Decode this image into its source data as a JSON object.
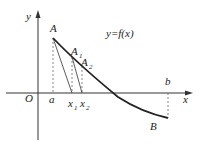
{
  "diagram": {
    "function_label": "y=f(x)",
    "axes": {
      "x_label": "x",
      "y_label": "y",
      "origin_label": "O"
    },
    "points": {
      "A": "A",
      "A1": "A",
      "A1_sub": "1",
      "A2": "A",
      "A2_sub": "2",
      "B": "B"
    },
    "x_ticks": {
      "a": "a",
      "b": "b",
      "x1": "x",
      "x1_sub": "1",
      "x2": "x",
      "x2_sub": "2"
    },
    "colors": {
      "stroke": "#222222",
      "background": "#ffffff"
    }
  }
}
